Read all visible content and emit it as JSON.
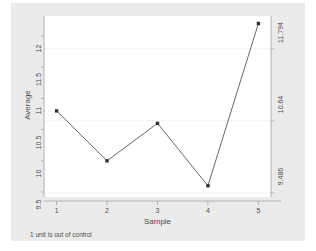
{
  "chart_data": {
    "type": "line",
    "title": "",
    "subtitle": "",
    "xlabel": "Sample",
    "ylabel": "Average",
    "x": [
      1,
      2,
      3,
      4,
      5
    ],
    "categories": [
      "1",
      "2",
      "3",
      "4",
      "5"
    ],
    "values": [
      10.8,
      10.0,
      10.6,
      9.6,
      12.2
    ],
    "series": [
      {
        "name": "Average",
        "values": [
          10.8,
          10.0,
          10.6,
          9.6,
          12.2
        ]
      }
    ],
    "xlim": [
      0.75,
      5.25
    ],
    "ylim": [
      9.42,
      12.32
    ],
    "grid": true,
    "legend": "none",
    "marker": "square",
    "line_color": "#555555",
    "marker_color": "#333333",
    "control_limits": {
      "lcl": 9.486,
      "center": 10.64,
      "ucl": 11.794
    },
    "annotation": "1 unit is out of control",
    "out_of_control_points": [
      5
    ]
  },
  "axes": {
    "y_left": {
      "label": "Average",
      "ticks": [
        "12",
        "11.5",
        "11",
        "10.5",
        "10",
        "9.5"
      ],
      "tick_values": [
        12,
        11.5,
        11,
        10.5,
        10,
        9.5
      ]
    },
    "y_right": {
      "label": "",
      "ticks": [
        "11.794",
        "10.64",
        "9.486"
      ],
      "tick_values": [
        11.794,
        10.64,
        9.486
      ]
    },
    "x": {
      "label": "Sample",
      "ticks": [
        "1",
        "2",
        "3",
        "4",
        "5"
      ],
      "tick_values": [
        1,
        2,
        3,
        4,
        5
      ]
    }
  },
  "note": {
    "text": "1 unit is out of control"
  },
  "colors": {
    "graph_region": "#ebebeb",
    "plot_region": "#ffffff",
    "axis_line": "#b0b0b0",
    "grid_line": "#f2f2f2",
    "series_line": "#555555",
    "marker": "#333333",
    "text": "#4d4d4d"
  }
}
